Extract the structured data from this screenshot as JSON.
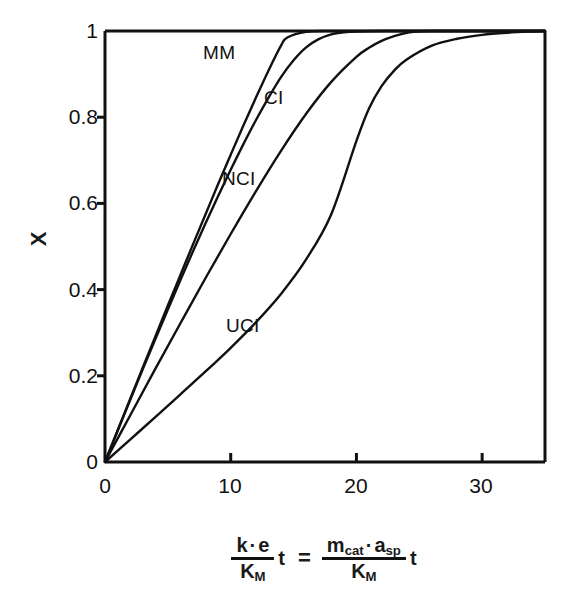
{
  "chart_data": {
    "type": "line",
    "title": "",
    "xlabel": "k·e / K_M · t = m_cat · a_sp / K_M · t",
    "ylabel": "X",
    "xlim": [
      0,
      35
    ],
    "ylim": [
      0,
      1
    ],
    "grid": false,
    "legend_position": "inline-curve-labels",
    "xticks": [
      0,
      10,
      20,
      30
    ],
    "xtick_labels": [
      "0",
      "10",
      "20",
      "30"
    ],
    "yticks": [
      0,
      0.2,
      0.4,
      0.6,
      0.8,
      1
    ],
    "ytick_labels": [
      "0",
      "0.2",
      "0.4",
      "0.6",
      "0.8",
      "1"
    ],
    "series": [
      {
        "name": "MM",
        "label": "MM",
        "x": [
          0,
          1,
          2,
          3,
          4,
          5,
          6,
          7,
          8,
          9,
          10,
          11,
          12,
          13,
          14,
          14.5,
          16,
          18,
          20,
          25,
          30,
          35
        ],
        "y": [
          0,
          0.073,
          0.146,
          0.219,
          0.291,
          0.363,
          0.434,
          0.505,
          0.575,
          0.645,
          0.713,
          0.78,
          0.845,
          0.908,
          0.966,
          0.985,
          0.998,
          1.0,
          1.0,
          1.0,
          1.0,
          1.0
        ]
      },
      {
        "name": "CI",
        "label": "CI",
        "x": [
          0,
          1,
          2,
          3,
          4,
          5,
          6,
          7,
          8,
          9,
          10,
          11,
          12,
          13,
          14,
          15,
          16,
          17,
          18,
          19,
          20,
          22,
          25,
          30,
          35
        ],
        "y": [
          0,
          0.072,
          0.144,
          0.215,
          0.285,
          0.354,
          0.422,
          0.489,
          0.554,
          0.617,
          0.678,
          0.737,
          0.793,
          0.845,
          0.893,
          0.932,
          0.962,
          0.981,
          0.992,
          0.997,
          0.999,
          1.0,
          1.0,
          1.0,
          1.0
        ]
      },
      {
        "name": "NCI",
        "label": "NCI",
        "x": [
          0,
          2,
          4,
          6,
          8,
          10,
          12,
          14,
          16,
          18,
          20,
          21,
          22,
          23,
          24,
          24.5,
          26,
          28,
          30,
          35
        ],
        "y": [
          0,
          0.108,
          0.216,
          0.322,
          0.427,
          0.529,
          0.628,
          0.722,
          0.808,
          0.882,
          0.94,
          0.961,
          0.977,
          0.988,
          0.996,
          0.998,
          1.0,
          1.0,
          1.0,
          1.0
        ]
      },
      {
        "name": "UCI",
        "label": "UCI",
        "x": [
          0,
          2,
          4,
          6,
          8,
          10,
          12,
          14,
          16,
          18,
          20,
          21,
          22,
          23,
          24,
          26,
          28,
          30,
          32,
          34,
          35
        ],
        "y": [
          0,
          0.052,
          0.104,
          0.157,
          0.21,
          0.265,
          0.324,
          0.39,
          0.47,
          0.575,
          0.745,
          0.82,
          0.872,
          0.908,
          0.934,
          0.966,
          0.982,
          0.991,
          0.996,
          0.999,
          1.0
        ]
      }
    ],
    "curve_labels": [
      {
        "text": "MM",
        "x": 6.3,
        "y": 0.905
      },
      {
        "text": "CI",
        "x": 11.9,
        "y": 0.805
      },
      {
        "text": "NCI",
        "x": 9.2,
        "y": 0.615
      },
      {
        "text": "UCI",
        "x": 9.5,
        "y": 0.285
      }
    ],
    "annotations": [],
    "colors": {
      "line": "#111111",
      "axis": "#111111",
      "background": "#ffffff"
    }
  },
  "axis": {
    "y_label": "X",
    "y_tick_labels": [
      "1",
      "0.8",
      "0.6",
      "0.4",
      "0.2",
      "0"
    ],
    "x_tick_labels": [
      "0",
      "10",
      "20",
      "30"
    ]
  },
  "formula": {
    "left_numerator_k": "k",
    "left_numerator_dot": "·",
    "left_numerator_e": "e",
    "left_denominator_K": "K",
    "left_denominator_sub": "M",
    "left_t": "t",
    "equals": "=",
    "right_numerator_m": "m",
    "right_numerator_m_sub": "cat",
    "right_numerator_dot": "·",
    "right_numerator_a": "a",
    "right_numerator_a_sub": "sp",
    "right_denominator_K": "K",
    "right_denominator_sub": "M",
    "right_t": "t"
  },
  "curve_labels": {
    "mm": "MM",
    "ci": "CI",
    "nci": "NCI",
    "uci": "UCI"
  }
}
